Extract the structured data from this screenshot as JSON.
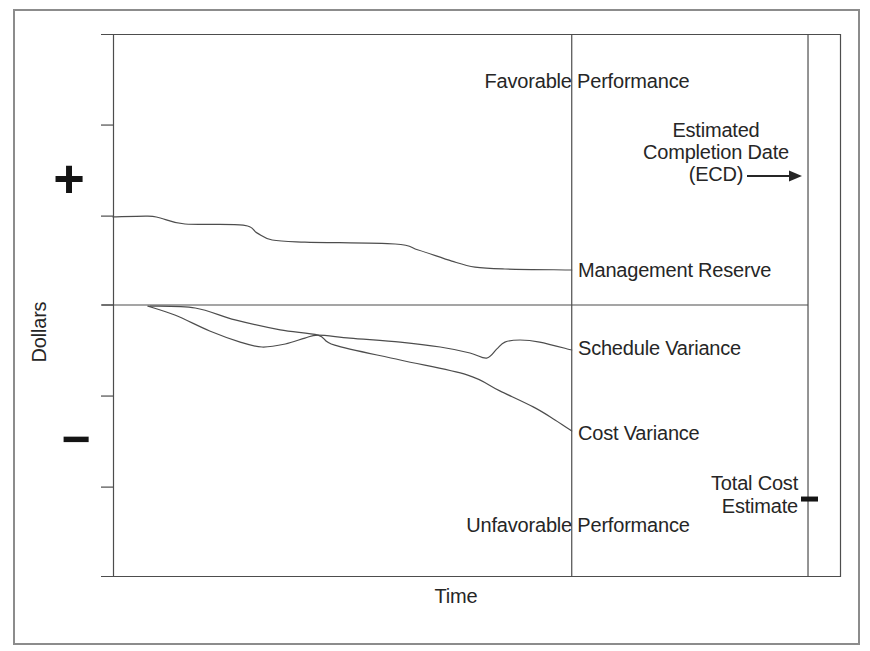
{
  "chart_data": {
    "type": "line",
    "title": "",
    "xlabel": "Time",
    "ylabel": "Dollars",
    "y_axis_sign_labels": {
      "plus": "+",
      "minus": "−"
    },
    "x_range": [
      0,
      100
    ],
    "y_range": [
      -100,
      100
    ],
    "x_ticks": [],
    "y_ticks": [
      66.4,
      32.8,
      0,
      -33.6,
      -67.2
    ],
    "grid": false,
    "legend_position": "inline-right-of-current-status-line",
    "series": [
      {
        "name": "Management Reserve",
        "points": [
          [
            0,
            32.5
          ],
          [
            4.8,
            32.8
          ],
          [
            6.5,
            32.1
          ],
          [
            9.9,
            29.9
          ],
          [
            17.9,
            29.5
          ],
          [
            19.8,
            26.6
          ],
          [
            21.9,
            24.0
          ],
          [
            26.4,
            23.2
          ],
          [
            38.8,
            22.5
          ],
          [
            42.0,
            20.3
          ],
          [
            46.6,
            16.2
          ],
          [
            49.8,
            14.0
          ],
          [
            53.9,
            13.3
          ],
          [
            63.1,
            12.9
          ]
        ]
      },
      {
        "name": "Schedule Variance",
        "points": [
          [
            4.8,
            -0.4
          ],
          [
            8.5,
            -3.7
          ],
          [
            13.3,
            -9.6
          ],
          [
            17.5,
            -13.7
          ],
          [
            20.5,
            -15.5
          ],
          [
            23.7,
            -14.4
          ],
          [
            26.4,
            -12.2
          ],
          [
            28.2,
            -11.1
          ],
          [
            32.6,
            -12.2
          ],
          [
            39.5,
            -13.7
          ],
          [
            45.0,
            -15.5
          ],
          [
            49.1,
            -17.7
          ],
          [
            51.4,
            -19.6
          ],
          [
            52.8,
            -16.2
          ],
          [
            53.9,
            -13.7
          ],
          [
            56.0,
            -12.9
          ],
          [
            58.7,
            -13.7
          ],
          [
            63.1,
            -16.6
          ]
        ]
      },
      {
        "name": "Cost Variance",
        "points": [
          [
            5.1,
            -0.4
          ],
          [
            11.3,
            -1.1
          ],
          [
            16.8,
            -5.5
          ],
          [
            23.0,
            -9.2
          ],
          [
            28.2,
            -11.1
          ],
          [
            30.5,
            -14.8
          ],
          [
            39.5,
            -20.3
          ],
          [
            48.7,
            -25.8
          ],
          [
            53.2,
            -31.7
          ],
          [
            57.8,
            -37.6
          ],
          [
            60.8,
            -42.4
          ],
          [
            63.1,
            -46.5
          ]
        ]
      }
    ],
    "reference_lines": [
      {
        "name": "zero-dollars-baseline",
        "axis": "y",
        "value": 0
      },
      {
        "name": "current-status-line",
        "axis": "x",
        "value": 63.1
      },
      {
        "name": "estimated-completion-date-line",
        "axis": "x",
        "value": 95.6
      }
    ],
    "markers": [
      {
        "name": "total-cost-estimate",
        "x": 95.6,
        "y": -71.6
      }
    ],
    "annotations": {
      "favorable": "Favorable Performance",
      "unfavorable": "Unfavorable Performance",
      "ecd_line1": "Estimated",
      "ecd_line2": "Completion Date",
      "ecd_line3": "(ECD)",
      "total_cost_line1": "Total Cost",
      "total_cost_line2": "Estimate"
    }
  },
  "colors": {
    "background": "#ffffff",
    "frame": "#8c8c8c",
    "line": "#4d4d4d",
    "text": "#262626",
    "marker": "#141414"
  }
}
